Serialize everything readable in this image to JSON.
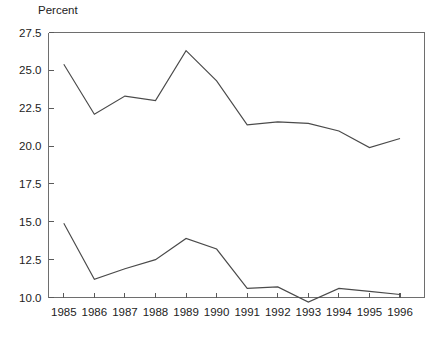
{
  "chart_data": {
    "type": "line",
    "title": "",
    "ylabel": "Percent",
    "xlabel": "",
    "grid": false,
    "legend": "none",
    "x": [
      1985,
      1986,
      1987,
      1988,
      1989,
      1990,
      1991,
      1992,
      1993,
      1994,
      1995,
      1996
    ],
    "categories": [
      "1985",
      "1986",
      "1987",
      "1988",
      "1989",
      "1990",
      "1991",
      "1992",
      "1993",
      "1994",
      "1995",
      "1996"
    ],
    "xlim": [
      1984.5,
      1996.8
    ],
    "ylim": [
      10.0,
      27.5
    ],
    "yticks": [
      10.0,
      12.5,
      15.0,
      17.5,
      20.0,
      22.5,
      25.0,
      27.5
    ],
    "ytick_labels": [
      "10.0",
      "12.5",
      "15.0",
      "17.5",
      "20.0",
      "22.5",
      "25.0",
      "27.5"
    ],
    "xticks": [
      1985,
      1986,
      1987,
      1988,
      1989,
      1990,
      1991,
      1992,
      1993,
      1994,
      1995,
      1996
    ],
    "xtick_labels": [
      "1985",
      "1986",
      "1987",
      "1988",
      "1989",
      "1990",
      "1991",
      "1992",
      "1993",
      "1994",
      "1995",
      "1996"
    ],
    "line_color": "#4a4a4a",
    "axis_color": "#6e6e6e",
    "series": [
      {
        "name": "upper-series",
        "values": [
          25.4,
          22.1,
          23.3,
          23.0,
          26.3,
          24.3,
          21.4,
          21.6,
          21.5,
          21.0,
          19.9,
          20.5
        ]
      },
      {
        "name": "lower-series",
        "values": [
          14.9,
          11.2,
          11.9,
          12.5,
          13.9,
          13.2,
          10.6,
          10.7,
          9.7,
          10.6,
          10.4,
          10.2
        ]
      }
    ]
  }
}
